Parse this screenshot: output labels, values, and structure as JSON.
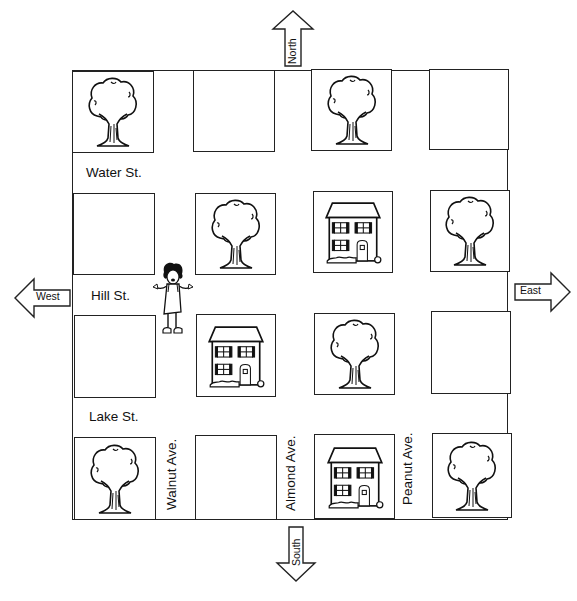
{
  "map": {
    "streets": [
      {
        "name": "Water St."
      },
      {
        "name": "Hill St."
      },
      {
        "name": "Lake St."
      }
    ],
    "avenues": [
      {
        "name": "Walnut Ave."
      },
      {
        "name": "Almond Ave."
      },
      {
        "name": "Peanut Ave."
      }
    ],
    "compass": {
      "north": "North",
      "south": "South",
      "east": "East",
      "west": "West"
    },
    "blocks": [
      [
        "tree",
        "empty",
        "tree",
        "empty"
      ],
      [
        "empty",
        "tree",
        "house",
        "tree"
      ],
      [
        "empty",
        "house",
        "tree",
        "empty"
      ],
      [
        "tree",
        "empty",
        "house",
        "tree"
      ]
    ],
    "character": {
      "type": "girl",
      "location": "Hill St. at Walnut Ave."
    },
    "colors": {
      "line": "#222222",
      "background": "#ffffff"
    }
  }
}
